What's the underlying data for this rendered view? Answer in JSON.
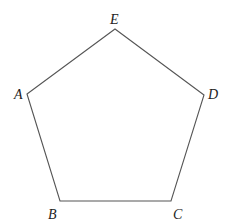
{
  "diagram": {
    "type": "regular-pentagon",
    "stroke_color": "#555555",
    "vertices": [
      {
        "label": "A",
        "x": 27,
        "y": 94,
        "label_x": 14,
        "label_y": 99
      },
      {
        "label": "B",
        "x": 60,
        "y": 201,
        "label_x": 48,
        "label_y": 219
      },
      {
        "label": "C",
        "x": 171,
        "y": 201,
        "label_x": 173,
        "label_y": 219
      },
      {
        "label": "D",
        "x": 204,
        "y": 95,
        "label_x": 208,
        "label_y": 99
      },
      {
        "label": "E",
        "x": 115,
        "y": 29,
        "label_x": 110,
        "label_y": 24
      }
    ]
  }
}
